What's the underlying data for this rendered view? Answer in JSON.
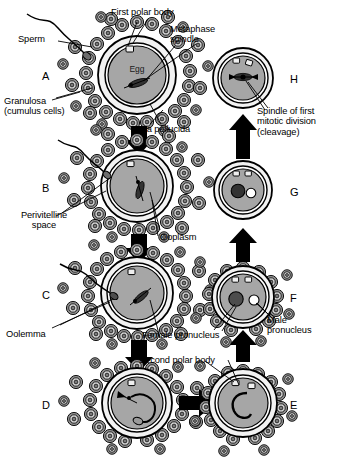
{
  "figure": {
    "background_color": "#ffffff",
    "line_color": "#000000"
  },
  "palette": {
    "zona_pellucida": "#f2f2f2",
    "perivitelline_space": "#ffffff",
    "ooplasm": "#a6a6a6",
    "ooplasm_inner": "#9a9a9a",
    "granulosa_outer": "#8c8c8c",
    "granulosa_inner": "#d9d9d9",
    "granulosa_core": "#7a7a7a",
    "polar_body_fill": "#efefef",
    "female_pronucleus": "#4d4d4d",
    "male_pronucleus": "#ffffff",
    "arrow_black": "#000000",
    "outline": "#000000"
  },
  "labels": [
    {
      "id": "sperm",
      "text": "Sperm",
      "x": 18,
      "y": 34,
      "align": "left"
    },
    {
      "id": "first-polar-body",
      "text": "First polar body",
      "x": 111,
      "y": 9,
      "align": "left"
    },
    {
      "id": "metaphase-spindle",
      "text": "Metaphase\nspindle",
      "x": 170,
      "y": 26,
      "align": "left"
    },
    {
      "id": "granulosa",
      "text": "Granulosa\n(cumulus cells)",
      "x": 8,
      "y": 96,
      "align": "left"
    },
    {
      "id": "zona-pellucida",
      "text": "Zona pellucida",
      "x": 133,
      "y": 126,
      "align": "left"
    },
    {
      "id": "spindle-first-mitotic",
      "text": "Spindle of first\nmitotic division\n(cleavage)",
      "x": 258,
      "y": 108,
      "align": "left"
    },
    {
      "id": "perivitelline-space",
      "text": "Perivitelline\nspace",
      "x": 4,
      "y": 212,
      "align": "left"
    },
    {
      "id": "ooplasm",
      "text": "Ooplasm",
      "x": 160,
      "y": 234,
      "align": "left"
    },
    {
      "id": "oolemma",
      "text": "Oolemma",
      "x": 8,
      "y": 331,
      "align": "left"
    },
    {
      "id": "female-pronucleus",
      "text": "Female pronucleus",
      "x": 144,
      "y": 332,
      "align": "left"
    },
    {
      "id": "second-polar-body",
      "text": "Second polar body",
      "x": 140,
      "y": 357,
      "align": "left"
    },
    {
      "id": "male-pronucleus",
      "text": "Male\npronucleus",
      "x": 268,
      "y": 317,
      "align": "left"
    }
  ],
  "panels": [
    {
      "id": "A",
      "letter": "A",
      "letter_x": 42,
      "letter_y": 68,
      "cx": 137,
      "cy": 75,
      "stage": "secondary-oocyte-with-cumulus"
    },
    {
      "id": "B",
      "letter": "B",
      "letter_x": 42,
      "letter_y": 181,
      "cx": 137,
      "cy": 186,
      "stage": "sperm-penetrating-cumulus"
    },
    {
      "id": "C",
      "letter": "C",
      "letter_x": 42,
      "letter_y": 289,
      "cx": 137,
      "cy": 293,
      "stage": "sperm-penetrating-zona"
    },
    {
      "id": "D",
      "letter": "D",
      "letter_x": 42,
      "letter_y": 399,
      "cx": 137,
      "cy": 403,
      "stage": "sperm-inside-ooplasm"
    },
    {
      "id": "E",
      "letter": "E",
      "letter_x": 290,
      "letter_y": 399,
      "cx": 243,
      "cy": 403,
      "stage": "second-polar-body-extruded"
    },
    {
      "id": "F",
      "letter": "F",
      "letter_x": 290,
      "letter_y": 291,
      "cx": 243,
      "cy": 297,
      "stage": "two-pronuclei"
    },
    {
      "id": "G",
      "letter": "G",
      "letter_x": 290,
      "letter_y": 186,
      "cx": 243,
      "cy": 190,
      "stage": "pronuclei-approaching"
    },
    {
      "id": "H",
      "letter": "H",
      "letter_x": 290,
      "letter_y": 73,
      "cx": 243,
      "cy": 78,
      "stage": "first-mitotic-spindle"
    }
  ],
  "flow_arrows": [
    {
      "id": "A-to-B",
      "from": "A",
      "to": "B",
      "direction": "down"
    },
    {
      "id": "B-to-C",
      "from": "B",
      "to": "C",
      "direction": "down"
    },
    {
      "id": "C-to-D",
      "from": "C",
      "to": "D",
      "direction": "down"
    },
    {
      "id": "D-to-E",
      "from": "D",
      "to": "E",
      "direction": "right"
    },
    {
      "id": "E-to-F",
      "from": "E",
      "to": "F",
      "direction": "up"
    },
    {
      "id": "F-to-G",
      "from": "F",
      "to": "G",
      "direction": "up"
    },
    {
      "id": "G-to-H",
      "from": "G",
      "to": "H",
      "direction": "up"
    }
  ],
  "egg_text": "Egg"
}
